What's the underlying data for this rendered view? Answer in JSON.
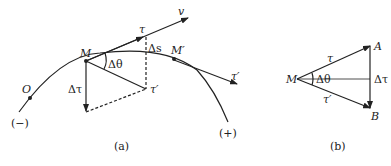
{
  "figure_a": {
    "caption": "(a)",
    "labels": {
      "v": "v",
      "tau": "τ",
      "delta_s": "Δs",
      "M": "M",
      "M_prime": "M′",
      "delta_theta": "Δθ",
      "delta_tau": "Δτ",
      "tau_prime": "τ′",
      "tau_prime_end": "τ′",
      "O": "O",
      "minus": "(−)",
      "plus": "(+)"
    }
  },
  "figure_b": {
    "caption": "(b)",
    "labels": {
      "M": "M",
      "A": "A",
      "B": "B",
      "tau": "τ",
      "tau_prime": "τ′",
      "delta_theta": "Δθ",
      "delta_tau": "Δτ"
    }
  },
  "colors": {
    "ink": "#222222"
  }
}
